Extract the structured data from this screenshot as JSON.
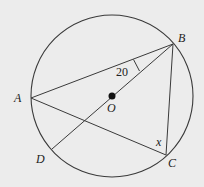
{
  "diagram": {
    "type": "circle-geometry",
    "circle": {
      "center_label": "O",
      "cx": 112,
      "cy": 96,
      "r": 81
    },
    "points": [
      {
        "label": "A",
        "x": 31,
        "y": 98
      },
      {
        "label": "B",
        "x": 173,
        "y": 44
      },
      {
        "label": "C",
        "x": 166,
        "y": 155
      },
      {
        "label": "D",
        "x": 52,
        "y": 149
      },
      {
        "label": "O",
        "x": 112,
        "y": 96
      }
    ],
    "segments": [
      "AB",
      "BC",
      "AC",
      "BD"
    ],
    "angles": [
      {
        "vertex": "B",
        "between": [
          "A",
          "D"
        ],
        "label": "20"
      },
      {
        "vertex": "C",
        "between": [
          "A",
          "B"
        ],
        "label": "x"
      }
    ],
    "colors": {
      "background": "#ececec",
      "stroke": "#3a3a3a"
    }
  },
  "labels": {
    "A": "A",
    "B": "B",
    "C": "C",
    "D": "D",
    "O": "O",
    "angle_B": "20",
    "angle_C": "x"
  }
}
